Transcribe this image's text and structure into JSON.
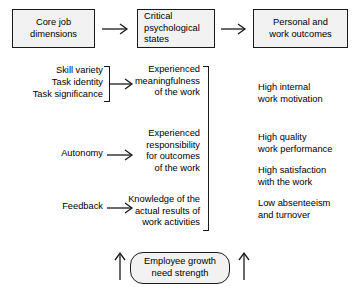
{
  "diagram": {
    "header_boxes": [
      {
        "id": "core-job-dimensions",
        "label": "Core job\ndimensions"
      },
      {
        "id": "critical-psychological-states",
        "label": "Critical\npsychological\nstates"
      },
      {
        "id": "personal-and-work-outcomes",
        "label": "Personal and\nwork outcomes"
      }
    ],
    "core_dimensions": [
      {
        "id": "skill-variety",
        "label": "Skill variety"
      },
      {
        "id": "task-identity",
        "label": "Task identity"
      },
      {
        "id": "task-significance",
        "label": "Task significance"
      },
      {
        "id": "autonomy",
        "label": "Autonomy"
      },
      {
        "id": "feedback",
        "label": "Feedback"
      }
    ],
    "psychological_states": [
      {
        "id": "experienced-meaningfulness",
        "label": "Experienced\nmeaningfulness\nof the work"
      },
      {
        "id": "experienced-responsibility",
        "label": "Experienced\nresponsibility\nfor outcomes\nof the work"
      },
      {
        "id": "knowledge-of-results",
        "label": "Knowledge of the\nactual results of\nwork activities"
      }
    ],
    "outcomes": [
      {
        "id": "high-internal-work-motivation",
        "label": "High internal\nwork motivation"
      },
      {
        "id": "high-quality-work-performance",
        "label": "High quality\nwork performance"
      },
      {
        "id": "high-satisfaction-with-the-work",
        "label": "High satisfaction\nwith the work"
      },
      {
        "id": "low-absenteeism-and-turnover",
        "label": "Low absenteeism\nand turnover"
      }
    ],
    "moderator": {
      "id": "employee-growth-need-strength",
      "label": "Employee growth\nneed strength"
    },
    "colors": {
      "box_fill": "#f2f2f2",
      "stroke": "#1a1a1a",
      "text": "#000000",
      "background": "#ffffff"
    }
  }
}
